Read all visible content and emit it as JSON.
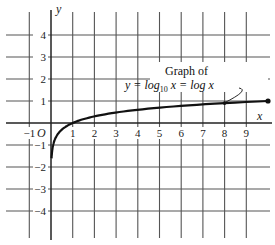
{
  "chart_data": {
    "type": "line",
    "title": "",
    "annotation": {
      "line1": "Graph of",
      "line2_prefix": "y = log",
      "line2_sub": "10",
      "line2_suffix": " x = log x"
    },
    "xlabel": "x",
    "ylabel": "y",
    "origin_label": "O",
    "xlim": [
      -1.5,
      10.2
    ],
    "ylim": [
      -4.8,
      4.8
    ],
    "x_ticks": [
      "-1",
      "1",
      "2",
      "3",
      "4",
      "5",
      "6",
      "7",
      "8",
      "9"
    ],
    "y_ticks": [
      "4",
      "3",
      "2",
      "1",
      "-1",
      "-2",
      "-3",
      "-4"
    ],
    "grid": true,
    "series": [
      {
        "name": "y = log10 x",
        "x": [
          0.025,
          0.05,
          0.1,
          0.2,
          0.5,
          1,
          2,
          3,
          4,
          5,
          6,
          7,
          8,
          9,
          10
        ],
        "y": [
          -1.6,
          -1.3,
          -1.0,
          -0.7,
          -0.3,
          0,
          0.301,
          0.477,
          0.602,
          0.699,
          0.778,
          0.845,
          0.903,
          0.954,
          1.0
        ]
      }
    ],
    "marked_points": [
      {
        "x": 8,
        "y": 0.903
      },
      {
        "x": 10,
        "y": 1.0
      }
    ]
  }
}
